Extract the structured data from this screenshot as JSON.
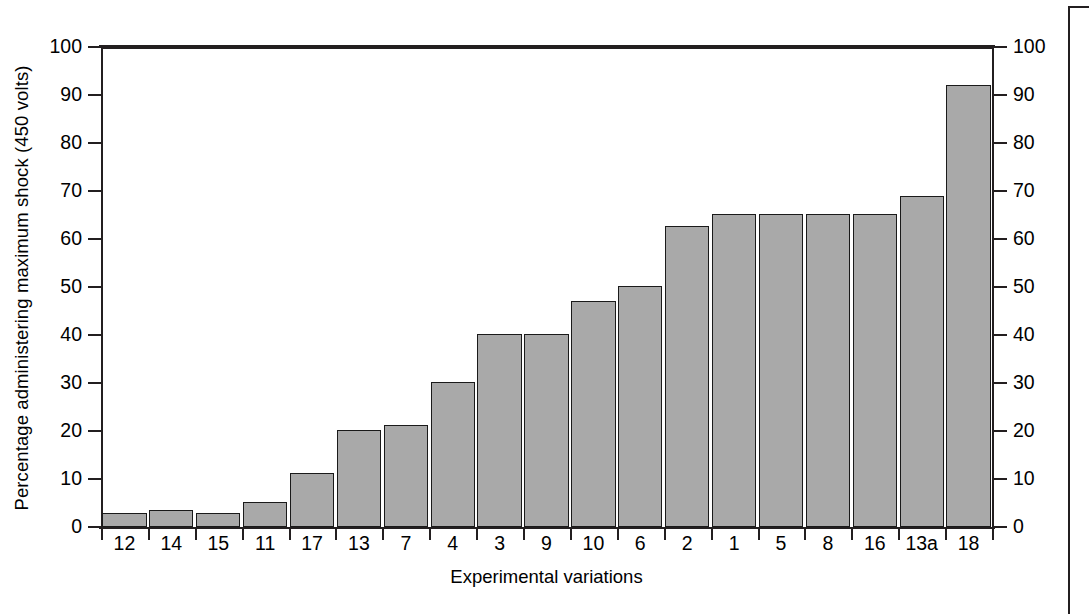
{
  "chart_data": {
    "type": "bar",
    "title": "",
    "xlabel": "Experimental variations",
    "ylabel": "Percentage administering maximum shock (450 volts)",
    "ylim": [
      0,
      100
    ],
    "yticks": [
      0,
      10,
      20,
      30,
      40,
      50,
      60,
      70,
      80,
      90,
      100
    ],
    "ytick_labels": [
      "0",
      "10",
      "20",
      "30",
      "40",
      "50",
      "60",
      "70",
      "80",
      "90",
      "100"
    ],
    "ytick_labels_right": [
      "0",
      "10",
      "20",
      "30",
      "40",
      "50",
      "60",
      "70",
      "80",
      "90",
      "100"
    ],
    "grid": false,
    "legend": null,
    "axis_right_mirrored": true,
    "categories": [
      "12",
      "14",
      "15",
      "11",
      "17",
      "13",
      "7",
      "4",
      "3",
      "9",
      "10",
      "6",
      "2",
      "1",
      "5",
      "8",
      "16",
      "13a",
      "18"
    ],
    "values": [
      3.0,
      3.6,
      3.0,
      5.3,
      11.2,
      20.2,
      21.3,
      30.3,
      40.3,
      40.3,
      47.0,
      50.2,
      62.7,
      65.2,
      65.2,
      65.2,
      65.2,
      69.0,
      92.0
    ],
    "bar_color": "#a9a9a9",
    "bar_edge_color": "#1a1a1a",
    "axis_color": "#231f20",
    "background_color": "#ffffff"
  },
  "figure": {
    "page_border_color": "#231f20"
  }
}
